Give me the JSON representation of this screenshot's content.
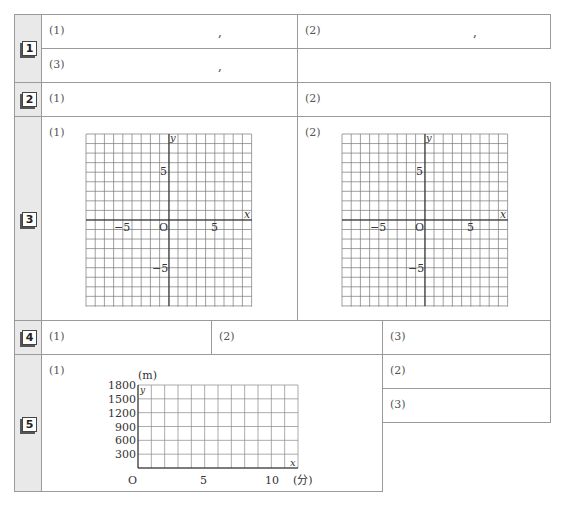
{
  "problems": [
    {
      "number": "1",
      "parts": [
        {
          "label": "(1)",
          "sep": ","
        },
        {
          "label": "(2)",
          "sep": ","
        },
        {
          "label": "(3)",
          "sep": ","
        }
      ]
    },
    {
      "number": "2",
      "parts": [
        {
          "label": "(1)"
        },
        {
          "label": "(2)"
        }
      ]
    },
    {
      "number": "3",
      "parts": [
        {
          "label": "(1)"
        },
        {
          "label": "(2)"
        }
      ]
    },
    {
      "number": "4",
      "parts": [
        {
          "label": "(1)"
        },
        {
          "label": "(2)"
        },
        {
          "label": "(3)"
        }
      ]
    },
    {
      "number": "5",
      "parts": [
        {
          "label": "(1)"
        },
        {
          "label": "(2)"
        },
        {
          "label": "(3)"
        }
      ]
    }
  ],
  "coord_grid": {
    "x_axis_label": "x",
    "y_axis_label": "y",
    "origin_label": "O",
    "range": [
      -9,
      9
    ],
    "tick_labels": {
      "x_neg": "−5",
      "x_pos": "5",
      "y_pos": "5",
      "y_neg": "−5"
    }
  },
  "graph5": {
    "y_unit": "(m)",
    "x_unit": "(分)",
    "y_axis_label": "y",
    "x_axis_label": "x",
    "origin_label": "O",
    "y_ticks": [
      "1800",
      "1500",
      "1200",
      "900",
      "600",
      "300"
    ],
    "x_ticks": [
      "5",
      "10"
    ],
    "x_max": 12,
    "y_max": 1800
  }
}
